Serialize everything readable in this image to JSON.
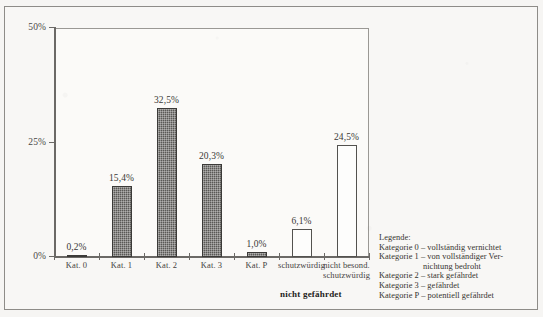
{
  "chart_data": {
    "type": "bar",
    "title": "",
    "xlabel": "",
    "ylabel": "",
    "ylim": [
      0,
      50
    ],
    "yticks": [
      0,
      25,
      50
    ],
    "ytick_labels": [
      "0%",
      "25%",
      "50%"
    ],
    "grid": false,
    "categories": [
      "Kat. 0",
      "Kat. 1",
      "Kat. 2",
      "Kat. 3",
      "Kat. P",
      "schutzwürdig",
      "nicht besond. schutzwürdig"
    ],
    "values": [
      0.2,
      15.4,
      32.5,
      20.3,
      1.0,
      6.1,
      24.5
    ],
    "value_labels": [
      "0,2%",
      "15,4%",
      "32,5%",
      "20,3%",
      "1,0%",
      "6,1%",
      "24,5%"
    ],
    "bar_styles": [
      "filled",
      "filled",
      "filled",
      "filled",
      "filled",
      "hollow",
      "hollow"
    ],
    "group_label": "nicht gefährdet",
    "colors": {
      "bar_filled": "#5a5956",
      "bar_hollow": "#fdfdfc",
      "bar_outline": "#3b3a38",
      "axis": "#6b6966",
      "text": "#35332f",
      "background": "#f8f7f5"
    }
  },
  "x_labels": [
    {
      "text": "Kat. 0",
      "wrap": false
    },
    {
      "text": "Kat. 1",
      "wrap": false
    },
    {
      "text": "Kat. 2",
      "wrap": false
    },
    {
      "text": "Kat. 3",
      "wrap": false
    },
    {
      "text": "Kat. P",
      "wrap": false
    },
    {
      "text": "schutzwürdig",
      "wrap": false
    },
    {
      "text": "nicht besond. schutzwürdig",
      "wrap": true
    }
  ],
  "legend": {
    "title": "Legende:",
    "lines": [
      {
        "text": "Kategorie 0 – vollständig vernichtet",
        "indent": false
      },
      {
        "text": "Kategorie 1 – von vollständiger Ver-",
        "indent": false
      },
      {
        "text": "nichtung bedroht",
        "indent": true
      },
      {
        "text": "Kategorie 2 – stark gefährdet",
        "indent": false
      },
      {
        "text": "Kategorie 3 – gefährdet",
        "indent": false
      },
      {
        "text": "Kategorie P – potentiell gefährdet",
        "indent": false
      }
    ]
  }
}
